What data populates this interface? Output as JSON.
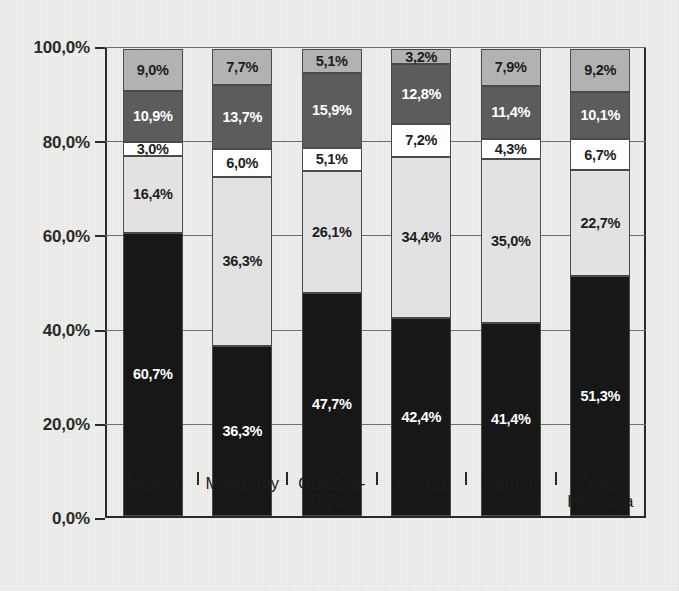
{
  "chart_data": {
    "type": "bar",
    "subtype": "stacked-bar-100-percent",
    "title": "",
    "subtitle": "",
    "xlabel": "",
    "ylabel": "",
    "ylim": [
      0,
      100
    ],
    "yticks": [
      0,
      20,
      40,
      60,
      80,
      100
    ],
    "ytick_labels": [
      "0,0%",
      "20,0%",
      "40,0%",
      "60,0%",
      "80,0%",
      "100,0%"
    ],
    "grid": true,
    "grid_axis": "y",
    "legend": false,
    "legend_position": "none",
    "value_labels": true,
    "decimal_separator": ",",
    "categories": [
      "México",
      "Monterrey",
      "Guadala-\njara",
      "Mérida",
      "Carmín",
      "Villa\nHermosa"
    ],
    "category_lines": [
      [
        "México"
      ],
      [
        "Monterrey"
      ],
      [
        "Guadala-",
        "jara"
      ],
      [
        "Mérida"
      ],
      [
        "Carmín"
      ],
      [
        "Villa",
        "Hermosa"
      ]
    ],
    "series": [
      {
        "name": "segment-1",
        "color": "#171717",
        "label_color": "#ffffff",
        "values": [
          60.7,
          36.3,
          47.7,
          42.4,
          41.4,
          51.3
        ],
        "labels": [
          "60,7%",
          "36,3%",
          "47,7%",
          "42,4%",
          "41,4%",
          "51,3%"
        ]
      },
      {
        "name": "segment-2",
        "color": "#e2e2e2",
        "label_color": "#1d1d1d",
        "values": [
          16.4,
          36.3,
          26.1,
          34.4,
          35.0,
          22.7
        ],
        "labels": [
          "16,4%",
          "36,3%",
          "26,1%",
          "34,4%",
          "35,0%",
          "22,7%"
        ]
      },
      {
        "name": "segment-3",
        "color": "#ffffff",
        "label_color": "#1d1d1d",
        "values": [
          3.0,
          6.0,
          5.1,
          7.2,
          4.3,
          6.7
        ],
        "labels": [
          "3,0%",
          "6,0%",
          "5,1%",
          "7,2%",
          "4,3%",
          "6,7%"
        ]
      },
      {
        "name": "segment-4",
        "color": "#5c5c5c",
        "label_color": "#ffffff",
        "values": [
          10.9,
          13.7,
          15.9,
          12.8,
          11.4,
          10.1
        ],
        "labels": [
          "10,9%",
          "13,7%",
          "15,9%",
          "12,8%",
          "11,4%",
          "10,1%"
        ]
      },
      {
        "name": "segment-5",
        "color": "#b2b2b2",
        "label_color": "#1d1d1d",
        "values": [
          9.0,
          7.7,
          5.1,
          3.2,
          7.9,
          9.2
        ],
        "labels": [
          "9,0%",
          "7,7%",
          "5,1%",
          "3,2%",
          "7,9%",
          "9,2%"
        ]
      }
    ]
  },
  "colors": {
    "background": "#f0f0ee",
    "axis": "#2a2a2a",
    "gridline": "#6f6f6f",
    "segment_border": "#4a4a4a"
  }
}
